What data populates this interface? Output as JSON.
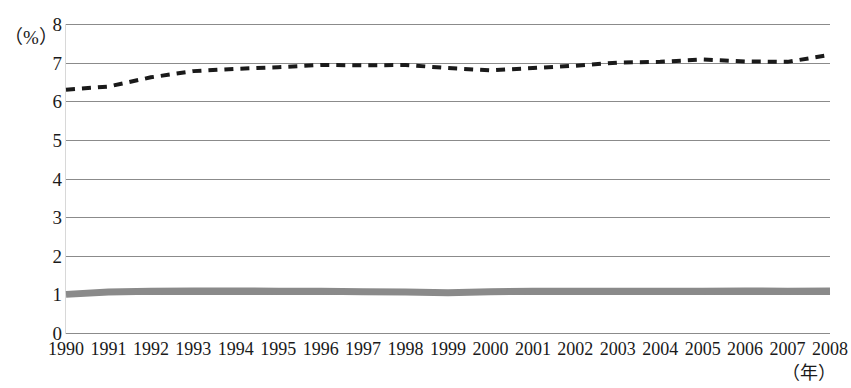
{
  "chart_data": {
    "type": "line",
    "title": "",
    "xlabel": "（年）",
    "ylabel": "（%）",
    "ylim": [
      0,
      8
    ],
    "ytick_step": 1,
    "ytick_labels": [
      "8",
      "7",
      "6",
      "5",
      "4",
      "3",
      "2",
      "1",
      "0"
    ],
    "grid": true,
    "legend": "none",
    "x": [
      "1990",
      "1991",
      "1992",
      "1993",
      "1994",
      "1995",
      "1996",
      "1997",
      "1998",
      "1999",
      "2000",
      "2001",
      "2002",
      "2003",
      "2004",
      "2005",
      "2006",
      "2007",
      "2008"
    ],
    "categories": [
      "1990",
      "1991",
      "1992",
      "1993",
      "1994",
      "1995",
      "1996",
      "1997",
      "1998",
      "1999",
      "2000",
      "2001",
      "2002",
      "2003",
      "2004",
      "2005",
      "2006",
      "2007",
      "2008"
    ],
    "series": [
      {
        "name": "dashed-series",
        "style": "dashed",
        "color": "#1a1a1a",
        "width": 4,
        "values": [
          6.3,
          6.38,
          6.62,
          6.78,
          6.84,
          6.88,
          6.94,
          6.93,
          6.94,
          6.86,
          6.8,
          6.86,
          6.92,
          7.0,
          7.02,
          7.08,
          7.03,
          7.02,
          7.2
        ]
      },
      {
        "name": "solid-gray-series",
        "style": "solid",
        "color": "#8a8a8a",
        "width": 7,
        "values": [
          1.0,
          1.06,
          1.08,
          1.09,
          1.09,
          1.08,
          1.08,
          1.07,
          1.06,
          1.04,
          1.07,
          1.08,
          1.08,
          1.08,
          1.08,
          1.08,
          1.09,
          1.08,
          1.09
        ]
      }
    ]
  },
  "axes": {
    "y_unit_label": "（%）",
    "x_unit_label": "（年）"
  },
  "title_remnant": ""
}
